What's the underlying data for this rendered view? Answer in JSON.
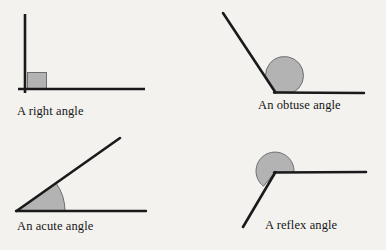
{
  "page": {
    "background_color": "#f3f2ef",
    "stroke_color": "#1a1a1a",
    "fill_color": "#b3b3b3",
    "fill_stroke_color": "#6e6e6e",
    "text_color": "#151515"
  },
  "figures": [
    {
      "id": "right-angle",
      "caption": "A right angle",
      "angle_type": "right",
      "angle_degrees": 90,
      "marker": "square",
      "vertex": {
        "x": 25,
        "y": 89
      },
      "rays": [
        {
          "name": "vertical-ray",
          "to": {
            "x": 25,
            "y": 14
          }
        },
        {
          "name": "horizontal-ray",
          "to": {
            "x": 145,
            "y": 89
          }
        }
      ],
      "marker_box": {
        "x": 27,
        "y": 72,
        "width": 20,
        "height": 17
      }
    },
    {
      "id": "obtuse-angle",
      "caption": "An obtuse angle",
      "angle_type": "obtuse",
      "angle_degrees": 120,
      "marker": "sector",
      "vertex": {
        "x": 275,
        "y": 92
      },
      "rays": [
        {
          "name": "upper-left-ray",
          "to": {
            "x": 223,
            "y": 13
          }
        },
        {
          "name": "horizontal-ray",
          "to": {
            "x": 364,
            "y": 93
          }
        }
      ],
      "marker_radius": 19
    },
    {
      "id": "acute-angle",
      "caption": "An acute angle",
      "angle_type": "acute",
      "angle_degrees": 35,
      "marker": "sector",
      "vertex": {
        "x": 17,
        "y": 211
      },
      "rays": [
        {
          "name": "upper-right-ray",
          "to": {
            "x": 120,
            "y": 138
          }
        },
        {
          "name": "horizontal-ray",
          "to": {
            "x": 146,
            "y": 211
          }
        }
      ],
      "marker_radius": 48
    },
    {
      "id": "reflex-angle",
      "caption": "A reflex angle",
      "angle_type": "reflex",
      "angle_degrees": 240,
      "marker": "sector",
      "vertex": {
        "x": 275,
        "y": 173
      },
      "rays": [
        {
          "name": "horizontal-ray",
          "to": {
            "x": 366,
            "y": 172
          }
        },
        {
          "name": "lower-left-ray",
          "to": {
            "x": 243,
            "y": 227
          }
        }
      ],
      "marker_radius": 19
    }
  ]
}
